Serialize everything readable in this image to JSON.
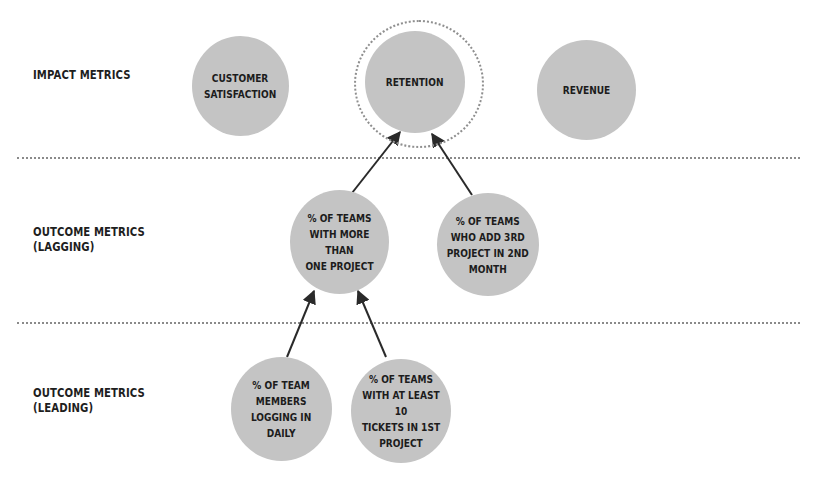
{
  "rows": [
    {
      "id": "impact",
      "label": "IMPACT METRICS"
    },
    {
      "id": "lagging",
      "label": "OUTCOME METRICS\n(LAGGING)"
    },
    {
      "id": "leading",
      "label": "OUTCOME METRICS\n(LEADING)"
    }
  ],
  "nodes": {
    "customer_satisfaction": "CUSTOMER\nSATISFACTION",
    "retention": "RETENTION",
    "revenue": "REVENUE",
    "teams_more_than_one_project": "% OF TEAMS\nWITH MORE THAN\nONE PROJECT",
    "teams_add_3rd_project": "% OF TEAMS\nWHO ADD 3RD\nPROJECT IN 2ND\nMONTH",
    "members_logging_daily": "% OF TEAM\nMEMBERS\nLOGGING IN\nDAILY",
    "teams_10_tickets": "% OF TEAMS\nWITH AT LEAST 10\nTICKETS IN 1ST\nPROJECT"
  },
  "edges": [
    {
      "from": "teams_more_than_one_project",
      "to": "retention"
    },
    {
      "from": "teams_add_3rd_project",
      "to": "retention"
    },
    {
      "from": "members_logging_daily",
      "to": "teams_more_than_one_project"
    },
    {
      "from": "teams_10_tickets",
      "to": "teams_more_than_one_project"
    }
  ],
  "highlighted_node": "retention",
  "colors": {
    "node_fill": "#c4c4c4",
    "text": "#1c1c1c",
    "divider": "#8a8a8a",
    "arrow": "#2a2a2a"
  }
}
